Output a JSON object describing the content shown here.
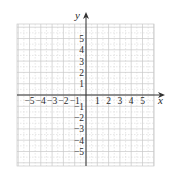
{
  "chart_data": {
    "type": "scatter",
    "title": "",
    "xlabel": "x",
    "ylabel": "y",
    "xlim": [
      -6,
      6
    ],
    "ylim": [
      -6,
      6
    ],
    "x_ticks": [
      -5,
      -4,
      -3,
      -2,
      -1,
      1,
      2,
      3,
      4,
      5
    ],
    "y_ticks": [
      5,
      4,
      3,
      2,
      1,
      -1,
      -2,
      -3,
      -4,
      -5
    ],
    "x_tick_labels": [
      "−5",
      "−4",
      "−3",
      "−2",
      "−1",
      "1",
      "2",
      "3",
      "4",
      "5"
    ],
    "y_tick_labels": [
      "5",
      "4",
      "3",
      "2",
      "1",
      "−1",
      "−2",
      "−3",
      "−4",
      "−5"
    ],
    "grid": true,
    "grid_major_step": 1,
    "grid_minor_step": 0.5,
    "series": [],
    "legend": null
  },
  "axes": {
    "x_label": "x",
    "y_label": "y"
  },
  "colors": {
    "axis": "#333333",
    "grid_major": "#c8c8c8",
    "grid_minor": "#dddddd",
    "text": "#2a2a2a"
  }
}
